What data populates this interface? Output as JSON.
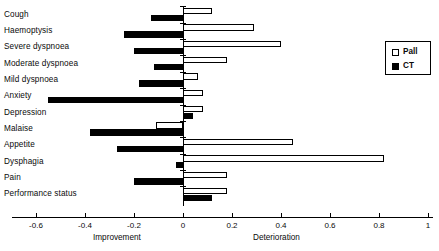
{
  "chart_data": {
    "type": "bar",
    "orientation": "horizontal",
    "title": "",
    "xlabel": "",
    "ylabel": "",
    "xlim": [
      -0.7,
      1.02
    ],
    "grid": false,
    "legend_position": "right",
    "axis_captions": {
      "left": "Improvement",
      "right": "Deterioration"
    },
    "tick_values": [
      -0.6,
      -0.4,
      -0.2,
      0,
      0.2,
      0.4,
      0.6,
      0.8,
      1
    ],
    "tick_labels": [
      "-0.6",
      "-0.4",
      "-0.2",
      "0",
      "0.2",
      "0.4",
      "0.6",
      "0.8",
      "1"
    ],
    "categories": [
      "Cough",
      "Haemoptysis",
      "Severe dyspnoea",
      "Moderate dyspnoea",
      "Mild dyspnoea",
      "Anxiety",
      "Depression",
      "Malaise",
      "Appetite",
      "Dysphagia",
      "Pain",
      "Performance status"
    ],
    "series": [
      {
        "name": "Pall",
        "style": "open",
        "color": "#ffffff",
        "edge_color": "#000000",
        "values": [
          0.12,
          0.29,
          0.4,
          0.18,
          0.06,
          0.08,
          0.08,
          -0.11,
          0.45,
          0.82,
          0.18,
          0.18
        ]
      },
      {
        "name": "CT",
        "style": "filled",
        "color": "#000000",
        "edge_color": "#000000",
        "values": [
          -0.13,
          -0.24,
          -0.2,
          -0.12,
          -0.18,
          -0.55,
          0.04,
          -0.38,
          -0.27,
          -0.03,
          -0.2,
          0.12
        ]
      }
    ]
  },
  "legend": {
    "items": [
      {
        "label": "Pall",
        "swatch": "open"
      },
      {
        "label": "CT",
        "swatch": "filled"
      }
    ]
  }
}
